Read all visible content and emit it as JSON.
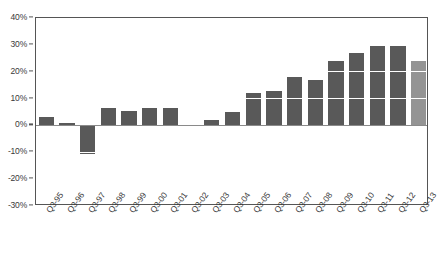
{
  "chart_data": {
    "type": "bar",
    "title": "",
    "xlabel": "",
    "ylabel": "",
    "grid": true,
    "legend": "none",
    "ylim": [
      -30,
      40
    ],
    "ytick_step": 10,
    "ytick_labels": [
      "40%",
      "30%",
      "20%",
      "10%",
      "0%",
      "-10%",
      "-20%",
      "-30%"
    ],
    "ytick_values": [
      40,
      30,
      20,
      10,
      0,
      -10,
      -20,
      -30
    ],
    "categories": [
      "Q3-95",
      "Q3-96",
      "Q3-97",
      "Q3-98",
      "Q3-99",
      "Q3-00",
      "Q3-01",
      "Q3-02",
      "Q3-03",
      "Q3-04",
      "Q3-05",
      "Q3-06",
      "Q3-07",
      "Q3-08",
      "Q3-09",
      "Q3-10",
      "Q3-11",
      "Q3-12",
      "Q3-13"
    ],
    "values": [
      3,
      1,
      -10.5,
      6.5,
      5.5,
      6.5,
      6.5,
      0,
      2,
      5,
      12,
      13,
      18,
      17,
      24,
      27,
      30,
      30.5,
      24
    ],
    "highlight_index": 18,
    "colors": {
      "bar": "#595959",
      "bar_highlight": "#949494",
      "gridline": "#ffffff",
      "zero_line": "#8a8a8a",
      "axis": "#555555",
      "text": "#3a3a3a",
      "background": "#ffffff"
    }
  }
}
